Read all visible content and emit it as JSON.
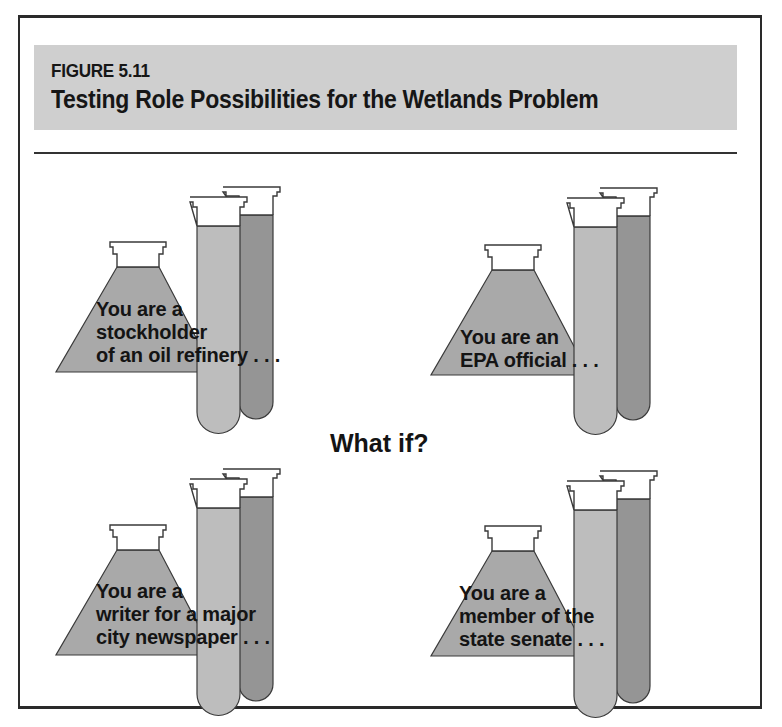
{
  "figure": {
    "label": "FIGURE 5.11",
    "title": "Testing Role Possibilities for the Wetlands Problem"
  },
  "center_label": "What if?",
  "colors": {
    "band": "#cfcfcf",
    "flask_fill": "#a9a9a9",
    "front_tube_fill": "#bdbdbd",
    "back_tube_fill": "#959595",
    "outline": "#3a3a3a",
    "text": "#141414"
  },
  "roles": [
    {
      "position": "top-left",
      "lines": [
        "You are a",
        "stockholder",
        "of an oil refinery . . ."
      ]
    },
    {
      "position": "top-right",
      "lines": [
        "You are an",
        "EPA official . . ."
      ]
    },
    {
      "position": "bottom-left",
      "lines": [
        "You are a",
        "writer for a major",
        "city newspaper . . ."
      ]
    },
    {
      "position": "bottom-right",
      "lines": [
        "You are a",
        "member of the",
        "state senate . . ."
      ]
    }
  ]
}
